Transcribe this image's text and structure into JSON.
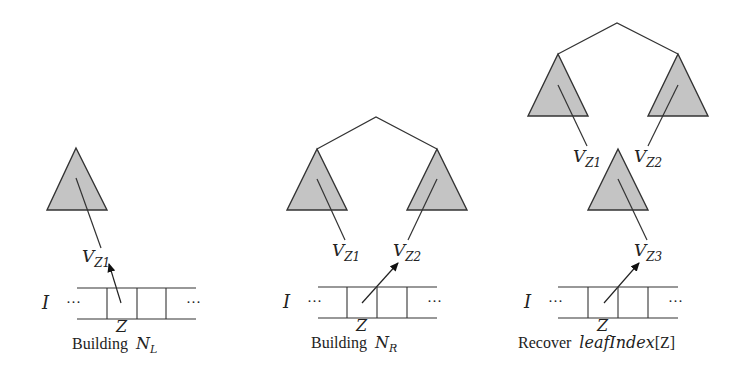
{
  "panels": [
    {
      "caption_prefix": "Building",
      "caption_math": "N",
      "caption_sub": "L",
      "array_label": "I",
      "cell_label": "Z",
      "dots": "···",
      "nodes": [
        {
          "label": "V",
          "sub": "Z1"
        }
      ]
    },
    {
      "caption_prefix": "Building",
      "caption_math": "N",
      "caption_sub": "R",
      "array_label": "I",
      "cell_label": "Z",
      "dots": "···",
      "nodes": [
        {
          "label": "V",
          "sub": "Z1"
        },
        {
          "label": "V",
          "sub": "Z2"
        }
      ]
    },
    {
      "caption_prefix": "Recover",
      "caption_math": "leafIndex",
      "caption_suffix": "[Z]",
      "array_label": "I",
      "cell_label": "Z",
      "dots": "···",
      "nodes": [
        {
          "label": "V",
          "sub": "Z1"
        },
        {
          "label": "V",
          "sub": "Z2"
        },
        {
          "label": "V",
          "sub": "Z3"
        }
      ]
    }
  ],
  "colors": {
    "triangle_fill": "#c4c4c4",
    "stroke": "#333333",
    "background": "#ffffff"
  }
}
